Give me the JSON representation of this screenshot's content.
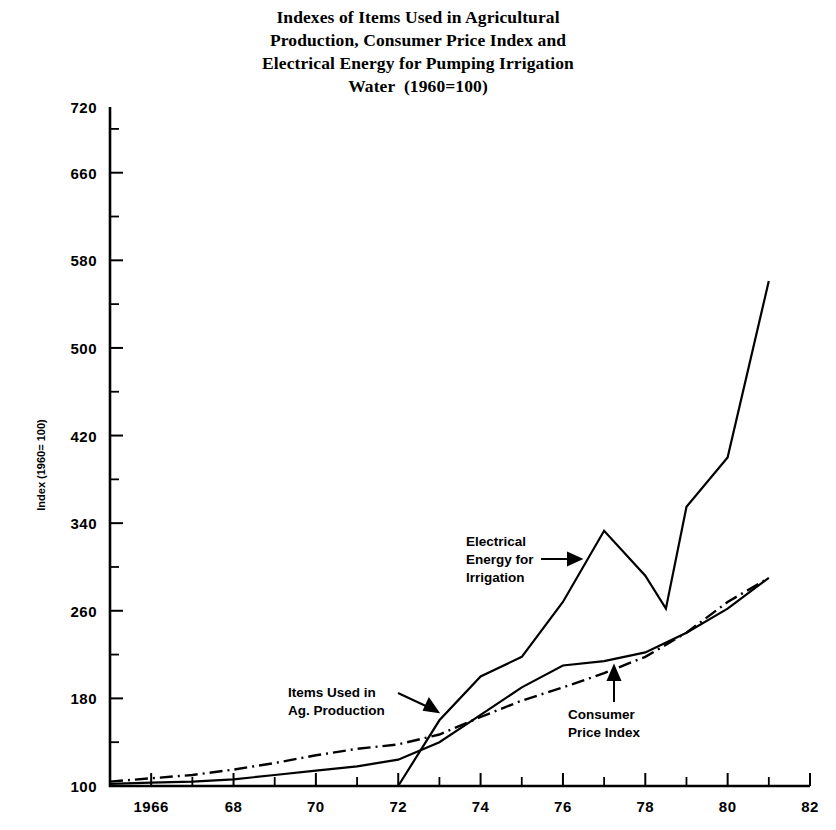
{
  "title": {
    "line1": "Indexes of Items Used in Agricultural",
    "line2": "Production, Consumer Price Index and",
    "line3": "Electrical Energy for Pumping Irrigation",
    "line4": "Water  (1960=100)"
  },
  "axes": {
    "ylabel": "Index (1960= 100)",
    "yticks": [
      "100",
      "180",
      "260",
      "340",
      "420",
      "500",
      "580",
      "660",
      "720"
    ],
    "xticks": [
      "1966",
      "68",
      "70",
      "72",
      "74",
      "76",
      "78",
      "80",
      "82"
    ]
  },
  "annotations": {
    "electrical": {
      "line1": "Electrical",
      "line2": "Energy for",
      "line3": "Irrigation"
    },
    "items": {
      "line1": "Items Used in",
      "line2": "Ag. Production"
    },
    "cpi": {
      "line1": "Consumer",
      "line2": "Price Index"
    }
  },
  "chart_data": {
    "type": "line",
    "title": "Indexes of Items Used in Agricultural Production, Consumer Price Index and Electrical Energy for Pumping Irrigation Water (1960=100)",
    "xlabel": "",
    "ylabel": "Index (1960= 100)",
    "xlim": [
      1965,
      1982
    ],
    "ylim": [
      100,
      720
    ],
    "ytick_values": [
      100,
      180,
      260,
      340,
      420,
      500,
      580,
      660,
      720
    ],
    "ytick_minor_step": 40,
    "xtick_values": [
      1966,
      1968,
      1970,
      1972,
      1974,
      1976,
      1978,
      1980,
      1982
    ],
    "xtick_minor_step": 1,
    "grid": false,
    "legend": "annotated-inline",
    "series": [
      {
        "name": "Items Used in Ag. Production",
        "style": "solid",
        "x": [
          1965,
          1966,
          1967,
          1968,
          1969,
          1970,
          1971,
          1972,
          1973,
          1974,
          1975,
          1976,
          1977,
          1978,
          1979,
          1980,
          1981
        ],
        "values": [
          102,
          103,
          104,
          106,
          110,
          114,
          118,
          124,
          140,
          165,
          190,
          210,
          214,
          222,
          240,
          262,
          290
        ]
      },
      {
        "name": "Consumer Price Index",
        "style": "dash-dot",
        "x": [
          1965,
          1966,
          1967,
          1968,
          1969,
          1970,
          1971,
          1972,
          1973,
          1974,
          1975,
          1976,
          1977,
          1978,
          1979,
          1980,
          1981
        ],
        "values": [
          104,
          107,
          110,
          115,
          121,
          128,
          134,
          138,
          147,
          163,
          178,
          190,
          203,
          218,
          240,
          268,
          290
        ]
      },
      {
        "name": "Electrical Energy for Irrigation",
        "style": "solid",
        "x": [
          1965,
          1966,
          1967,
          1968,
          1969,
          1970,
          1971,
          1972,
          1973,
          1974,
          1975,
          1976,
          1977,
          1978,
          1978.5,
          1979,
          1980,
          1981
        ],
        "values": [
          100,
          100,
          100,
          100,
          100,
          100,
          100,
          100,
          160,
          200,
          218,
          268,
          333,
          292,
          262,
          355,
          400,
          561
        ]
      }
    ]
  }
}
